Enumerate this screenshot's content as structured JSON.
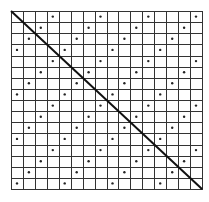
{
  "figure": {
    "grid": {
      "columns": 16,
      "rows": 16,
      "left": 11,
      "top": 11,
      "right": 202,
      "bottom": 189,
      "line_color": "#333333",
      "line_width": 1
    },
    "diagonal": {
      "from": "top-left",
      "to": "bottom-right",
      "color": "#111111",
      "width": 2
    },
    "dots": {
      "color": "#222222",
      "radius": 1.2,
      "rule": "(column + row) mod 4 == 3",
      "cells": [
        [
          0,
          3
        ],
        [
          0,
          7
        ],
        [
          0,
          11
        ],
        [
          0,
          15
        ],
        [
          1,
          2
        ],
        [
          1,
          6
        ],
        [
          1,
          10
        ],
        [
          1,
          14
        ],
        [
          2,
          1
        ],
        [
          2,
          5
        ],
        [
          2,
          9
        ],
        [
          2,
          13
        ],
        [
          3,
          0
        ],
        [
          3,
          4
        ],
        [
          3,
          8
        ],
        [
          3,
          12
        ],
        [
          4,
          3
        ],
        [
          4,
          7
        ],
        [
          4,
          11
        ],
        [
          4,
          15
        ],
        [
          5,
          2
        ],
        [
          5,
          6
        ],
        [
          5,
          10
        ],
        [
          5,
          14
        ],
        [
          6,
          1
        ],
        [
          6,
          5
        ],
        [
          6,
          9
        ],
        [
          6,
          13
        ],
        [
          7,
          0
        ],
        [
          7,
          4
        ],
        [
          7,
          8
        ],
        [
          7,
          12
        ],
        [
          8,
          3
        ],
        [
          8,
          7
        ],
        [
          8,
          11
        ],
        [
          8,
          15
        ],
        [
          9,
          2
        ],
        [
          9,
          6
        ],
        [
          9,
          10
        ],
        [
          9,
          14
        ],
        [
          10,
          1
        ],
        [
          10,
          5
        ],
        [
          10,
          9
        ],
        [
          10,
          13
        ],
        [
          11,
          0
        ],
        [
          11,
          4
        ],
        [
          11,
          8
        ],
        [
          11,
          12
        ],
        [
          12,
          3
        ],
        [
          12,
          7
        ],
        [
          12,
          11
        ],
        [
          12,
          15
        ],
        [
          13,
          2
        ],
        [
          13,
          6
        ],
        [
          13,
          10
        ],
        [
          13,
          14
        ],
        [
          14,
          1
        ],
        [
          14,
          5
        ],
        [
          14,
          9
        ],
        [
          14,
          13
        ],
        [
          15,
          0
        ],
        [
          15,
          4
        ],
        [
          15,
          8
        ],
        [
          15,
          12
        ]
      ]
    }
  }
}
